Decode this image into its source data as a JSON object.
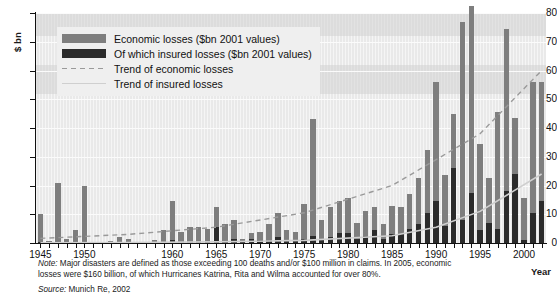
{
  "axes": {
    "y_title": "$ bn",
    "x_title": "Year",
    "y_ticks": [
      "0",
      "10",
      "20",
      "30",
      "40",
      "50",
      "60",
      "70",
      "80"
    ],
    "x_ticks": [
      "1945",
      "1950",
      "1960",
      "1965",
      "1970",
      "1975",
      "1980",
      "1985",
      "1990",
      "1995",
      "2000"
    ]
  },
  "legend": {
    "items": [
      {
        "label": "Economic losses ($bn 2001 values)",
        "type": "swatch",
        "color": "#7e7e7e"
      },
      {
        "label": "Of which insured losses ($bn 2001 values)",
        "type": "swatch",
        "color": "#2b2b2b"
      },
      {
        "label": "Trend of economic losses",
        "type": "dashed-line",
        "color": "#9a9a9a"
      },
      {
        "label": "Trend of insured losses",
        "type": "solid-line",
        "color": "#cfcfcf"
      }
    ]
  },
  "footnotes": {
    "note_label": "Note:",
    "note_text": " Major disasters are defined as those exceeding 100 deaths and/or $100 million in claims. In 2005, economic losses were $160 billion, of which Hurricanes Katrina, Rita and Wilma accounted for over 80%.",
    "source_label": "Source:",
    "source_text": " Munich Re, 2002"
  },
  "chart_data": {
    "type": "bar",
    "title": "",
    "xlabel": "Year",
    "ylabel": "$ bn",
    "ylim": [
      0,
      80
    ],
    "xlim": [
      1944.5,
      2002.5
    ],
    "grid": true,
    "legend_position": "top-left",
    "x": [
      1945,
      1946,
      1947,
      1948,
      1949,
      1950,
      1951,
      1952,
      1953,
      1954,
      1955,
      1956,
      1957,
      1958,
      1959,
      1960,
      1961,
      1962,
      1963,
      1964,
      1965,
      1966,
      1967,
      1968,
      1969,
      1970,
      1971,
      1972,
      1973,
      1974,
      1975,
      1976,
      1977,
      1978,
      1979,
      1980,
      1981,
      1982,
      1983,
      1984,
      1985,
      1986,
      1987,
      1988,
      1989,
      1990,
      1991,
      1992,
      1993,
      1994,
      1995,
      1996,
      1997,
      1998,
      1999,
      2000,
      2001,
      2002
    ],
    "series": [
      {
        "name": "Economic losses ($bn 2001 values)",
        "color": "#7e7e7e",
        "values": [
          10,
          0.6,
          21,
          1.4,
          4.5,
          20,
          0.5,
          0.4,
          0.8,
          2.2,
          1.4,
          0.3,
          0.5,
          1.0,
          4.5,
          14.5,
          4.0,
          5.5,
          5.5,
          5.0,
          12.5,
          6.5,
          8.0,
          1.5,
          3.5,
          4.0,
          6.5,
          10.5,
          4.5,
          4.0,
          13.5,
          43.0,
          8.0,
          12.5,
          14.5,
          15.5,
          7.0,
          11.0,
          12.5,
          6.5,
          13.0,
          12.5,
          17.0,
          22.5,
          32.5,
          56.0,
          23.5,
          45.0,
          77.0,
          82.5,
          34.5,
          22.5,
          45.5,
          74.5,
          43.5,
          15.5,
          56.0,
          56.0
        ]
      },
      {
        "name": "Of which insured losses ($bn 2001 values)",
        "color": "#2b2b2b",
        "values": [
          0.2,
          0.1,
          0.3,
          0.1,
          0.2,
          0.5,
          0.1,
          0.1,
          0.1,
          0.2,
          0.2,
          0.1,
          0.1,
          0.1,
          0.3,
          1.0,
          0.4,
          0.5,
          0.5,
          0.4,
          5.5,
          0.6,
          1.5,
          0.3,
          1.5,
          1.2,
          1.0,
          2.0,
          0.8,
          1.0,
          1.5,
          2.5,
          1.5,
          2.0,
          3.5,
          3.5,
          1.5,
          2.5,
          4.5,
          1.5,
          3.0,
          3.0,
          5.0,
          6.5,
          10.5,
          14.5,
          6.0,
          26.0,
          8.0,
          17.5,
          4.5,
          7.0,
          5.0,
          18.0,
          24.0,
          1.0,
          10.5,
          14.5
        ]
      }
    ],
    "trend_economic": {
      "name": "Trend of economic losses",
      "color": "#9a9a9a",
      "style": "dashed",
      "points": [
        [
          1945,
          1.6
        ],
        [
          1955,
          3.0
        ],
        [
          1965,
          5.5
        ],
        [
          1975,
          10.5
        ],
        [
          1985,
          20.0
        ],
        [
          1995,
          38.0
        ],
        [
          2002,
          60.0
        ]
      ]
    },
    "trend_insured": {
      "name": "Trend of insured losses",
      "color": "#cfcfcf",
      "style": "solid",
      "points": [
        [
          1945,
          0.1
        ],
        [
          1955,
          0.2
        ],
        [
          1965,
          0.4
        ],
        [
          1975,
          0.9
        ],
        [
          1985,
          2.5
        ],
        [
          1990,
          5.5
        ],
        [
          1995,
          11.0
        ],
        [
          2002,
          24.0
        ]
      ]
    }
  }
}
